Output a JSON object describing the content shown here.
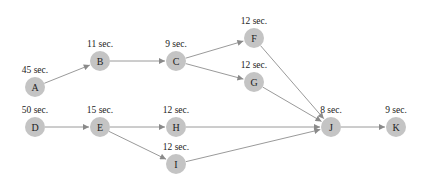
{
  "diagram": {
    "type": "activity-network",
    "node_color": "#c4c4c4",
    "edge_color": "#9a9a9a",
    "nodes": [
      {
        "id": "A",
        "label": "A",
        "duration": "45 sec.",
        "x": 35,
        "y": 87
      },
      {
        "id": "B",
        "label": "B",
        "duration": "11 sec.",
        "x": 100,
        "y": 61
      },
      {
        "id": "C",
        "label": "C",
        "duration": "9 sec.",
        "x": 176,
        "y": 61
      },
      {
        "id": "F",
        "label": "F",
        "duration": "12 sec.",
        "x": 254,
        "y": 38
      },
      {
        "id": "G",
        "label": "G",
        "duration": "12 sec.",
        "x": 254,
        "y": 82
      },
      {
        "id": "D",
        "label": "D",
        "duration": "50 sec.",
        "x": 35,
        "y": 127
      },
      {
        "id": "E",
        "label": "E",
        "duration": "15 sec.",
        "x": 100,
        "y": 127
      },
      {
        "id": "H",
        "label": "H",
        "duration": "12 sec.",
        "x": 176,
        "y": 127
      },
      {
        "id": "I",
        "label": "I",
        "duration": "12 sec.",
        "x": 176,
        "y": 164
      },
      {
        "id": "J",
        "label": "J",
        "duration": "8 sec.",
        "x": 331,
        "y": 127
      },
      {
        "id": "K",
        "label": "K",
        "duration": "9 sec.",
        "x": 396,
        "y": 127
      }
    ],
    "edges": [
      {
        "from": "A",
        "to": "B"
      },
      {
        "from": "B",
        "to": "C"
      },
      {
        "from": "C",
        "to": "F"
      },
      {
        "from": "C",
        "to": "G"
      },
      {
        "from": "F",
        "to": "J"
      },
      {
        "from": "G",
        "to": "J"
      },
      {
        "from": "D",
        "to": "E"
      },
      {
        "from": "E",
        "to": "H"
      },
      {
        "from": "E",
        "to": "I"
      },
      {
        "from": "H",
        "to": "J"
      },
      {
        "from": "I",
        "to": "J"
      },
      {
        "from": "J",
        "to": "K"
      }
    ]
  }
}
